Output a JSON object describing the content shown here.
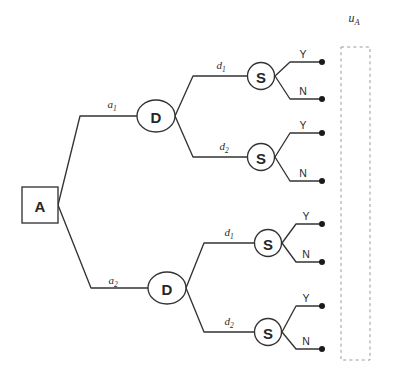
{
  "diagram": {
    "colors": {
      "stroke": "#333333",
      "node_fill": "#ffffff",
      "terminal_dot": "#1a1a1a",
      "utility_box_stroke": "#9a9a9a",
      "background": "#ffffff"
    },
    "root": {
      "label": "A",
      "shape": "square"
    },
    "decision_nodes": [
      {
        "label": "D",
        "shape": "ellipse",
        "id": "decision-top"
      },
      {
        "label": "D",
        "shape": "ellipse",
        "id": "decision-bottom"
      }
    ],
    "chance_nodes": [
      {
        "label": "S",
        "shape": "circle",
        "id": "chance-1"
      },
      {
        "label": "S",
        "shape": "circle",
        "id": "chance-2"
      },
      {
        "label": "S",
        "shape": "circle",
        "id": "chance-3"
      },
      {
        "label": "S",
        "shape": "circle",
        "id": "chance-4"
      }
    ],
    "action_edges": [
      {
        "base": "a",
        "sub": "1",
        "id": "edge-a1"
      },
      {
        "base": "a",
        "sub": "2",
        "id": "edge-a2"
      }
    ],
    "decision_edges": [
      {
        "base": "d",
        "sub": "1",
        "id": "edge-d1-top"
      },
      {
        "base": "d",
        "sub": "2",
        "id": "edge-d2-top"
      },
      {
        "base": "d",
        "sub": "1",
        "id": "edge-d1-bottom"
      },
      {
        "base": "d",
        "sub": "2",
        "id": "edge-d2-bottom"
      }
    ],
    "outcomes": [
      {
        "label": "Y",
        "id": "outcome-1"
      },
      {
        "label": "N",
        "id": "outcome-2"
      },
      {
        "label": "Y",
        "id": "outcome-3"
      },
      {
        "label": "N",
        "id": "outcome-4"
      },
      {
        "label": "Y",
        "id": "outcome-5"
      },
      {
        "label": "N",
        "id": "outcome-6"
      },
      {
        "label": "Y",
        "id": "outcome-7"
      },
      {
        "label": "N",
        "id": "outcome-8"
      }
    ],
    "utility": {
      "base": "u",
      "sub": "A"
    }
  }
}
